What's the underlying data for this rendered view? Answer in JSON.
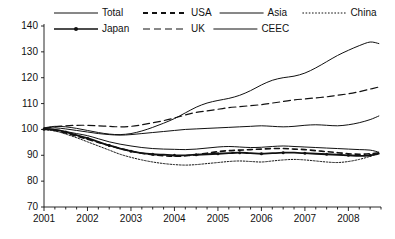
{
  "chart_data": {
    "type": "line",
    "title": "",
    "subtitle": "",
    "xlabel": "",
    "ylabel": "",
    "xlim": [
      2001.0,
      2008.75
    ],
    "ylim": [
      70,
      140
    ],
    "grid": false,
    "legend_position": "top",
    "y_ticks": [
      70,
      80,
      90,
      100,
      110,
      120,
      130,
      140
    ],
    "y_tick_labels": [
      "70",
      "80",
      "90",
      "100",
      "110",
      "120",
      "130",
      "140"
    ],
    "x_ticks": [
      2001,
      2002,
      2003,
      2004,
      2005,
      2006,
      2007,
      2008
    ],
    "x_tick_labels": [
      "2001",
      "2002",
      "2003",
      "2004",
      "2005",
      "2006",
      "2007",
      "2008"
    ],
    "x_minor_tick_interval": 0.25,
    "index_base": 100,
    "x": [
      2001.0,
      2001.25,
      2001.5,
      2001.75,
      2002.0,
      2002.25,
      2002.5,
      2002.75,
      2003.0,
      2003.25,
      2003.5,
      2003.75,
      2004.0,
      2004.25,
      2004.5,
      2004.75,
      2005.0,
      2005.25,
      2005.5,
      2005.75,
      2006.0,
      2006.25,
      2006.5,
      2006.75,
      2007.0,
      2007.25,
      2007.5,
      2007.75,
      2008.0,
      2008.25,
      2008.5,
      2008.7
    ],
    "series": [
      {
        "name": "Total",
        "style": "solid",
        "width": 1.0,
        "color": "#111111",
        "values": [
          100.3,
          100.0,
          99.2,
          98.4,
          97.6,
          96.4,
          95.2,
          94.3,
          93.6,
          93.0,
          92.6,
          92.4,
          92.3,
          92.2,
          92.4,
          92.8,
          93.2,
          93.4,
          93.2,
          93.0,
          93.1,
          93.4,
          93.6,
          93.4,
          93.2,
          93.0,
          92.8,
          92.6,
          92.4,
          92.2,
          92.0,
          91.2
        ]
      },
      {
        "name": "USA",
        "style": "dashed-thick",
        "width": 1.6,
        "color": "#111111",
        "values": [
          100.2,
          99.6,
          98.6,
          97.4,
          96.2,
          95.0,
          93.8,
          92.6,
          91.6,
          90.8,
          90.2,
          89.8,
          89.6,
          89.8,
          90.2,
          90.8,
          91.4,
          91.8,
          92.0,
          92.2,
          92.4,
          92.6,
          92.6,
          92.4,
          92.2,
          91.8,
          91.4,
          91.0,
          90.6,
          90.4,
          90.6,
          91.0
        ]
      },
      {
        "name": "Asia",
        "style": "solid",
        "width": 1.0,
        "color": "#111111",
        "values": [
          100.4,
          100.6,
          100.2,
          99.6,
          99.0,
          98.4,
          98.0,
          97.8,
          98.0,
          98.4,
          98.8,
          99.2,
          99.6,
          100.0,
          100.2,
          100.4,
          100.6,
          100.8,
          101.0,
          101.2,
          101.4,
          101.2,
          101.0,
          101.2,
          101.6,
          101.8,
          101.6,
          101.4,
          101.8,
          102.6,
          103.8,
          105.2
        ]
      },
      {
        "name": "China",
        "style": "dotted-fine",
        "width": 1.0,
        "color": "#111111",
        "values": [
          100.0,
          99.4,
          98.2,
          96.8,
          95.2,
          93.6,
          92.0,
          90.4,
          89.2,
          88.2,
          87.4,
          86.8,
          86.4,
          86.2,
          86.4,
          86.8,
          87.2,
          87.6,
          87.8,
          87.6,
          87.4,
          87.8,
          88.2,
          88.4,
          88.2,
          87.8,
          87.4,
          87.2,
          87.6,
          88.4,
          89.6,
          90.8
        ]
      },
      {
        "name": "Japan",
        "style": "marker-line",
        "width": 1.8,
        "color": "#111111",
        "values": [
          100.1,
          99.8,
          99.0,
          97.8,
          96.6,
          95.2,
          93.8,
          92.6,
          91.6,
          90.8,
          90.4,
          90.2,
          90.0,
          90.0,
          90.2,
          90.4,
          90.6,
          90.8,
          91.0,
          90.8,
          90.6,
          90.8,
          91.0,
          91.0,
          90.8,
          90.6,
          90.4,
          90.2,
          90.0,
          89.8,
          90.0,
          90.6
        ]
      },
      {
        "name": "UK",
        "style": "dashed-long",
        "width": 1.2,
        "color": "#111111",
        "values": [
          100.5,
          101.0,
          101.4,
          101.6,
          101.6,
          101.4,
          101.2,
          101.0,
          101.2,
          101.8,
          102.6,
          103.4,
          104.4,
          105.6,
          106.6,
          107.2,
          107.8,
          108.4,
          108.8,
          109.2,
          109.6,
          110.2,
          110.8,
          111.4,
          111.8,
          112.2,
          112.6,
          113.2,
          113.8,
          114.6,
          115.6,
          116.4
        ]
      },
      {
        "name": "CEEC",
        "style": "solid",
        "width": 1.0,
        "color": "#111111",
        "values": [
          100.6,
          101.2,
          101.0,
          100.4,
          99.6,
          98.8,
          98.2,
          98.0,
          98.4,
          99.4,
          100.8,
          102.4,
          104.2,
          106.4,
          108.6,
          110.2,
          111.2,
          112.0,
          113.2,
          115.0,
          117.2,
          119.0,
          120.0,
          120.6,
          121.8,
          123.8,
          126.2,
          128.6,
          130.6,
          132.4,
          133.8,
          133.2
        ]
      }
    ]
  },
  "legend": {
    "row1": [
      {
        "label": "Total",
        "style": "solid"
      },
      {
        "label": "USA",
        "style": "dashed-thick"
      },
      {
        "label": "Asia",
        "style": "solid"
      },
      {
        "label": "China",
        "style": "dotted-fine"
      }
    ],
    "row2": [
      {
        "label": "Japan",
        "style": "marker-line"
      },
      {
        "label": "UK",
        "style": "dashed-long"
      },
      {
        "label": "CEEC",
        "style": "solid"
      }
    ]
  }
}
